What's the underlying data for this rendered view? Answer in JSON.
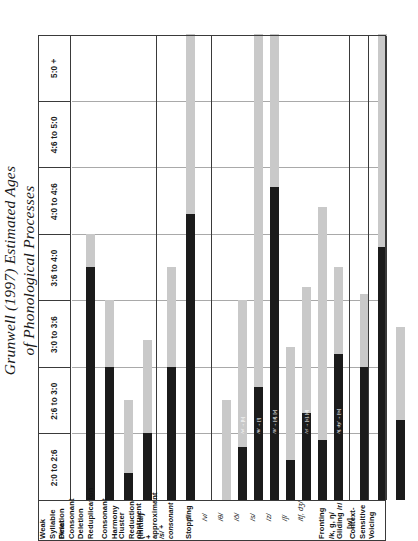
{
  "title": {
    "line1": "Grunwell (1997) Estimated Ages",
    "line2": "of Phonological Processes"
  },
  "axis": {
    "bands": [
      "2:0 to 2:6",
      "2:6 to 3:0",
      "3:0 to 3:6",
      "3:6 to 4:0",
      "4:0 to 4:6",
      "4:6 to 5:0",
      "5:0 +"
    ]
  },
  "rows": [
    {
      "label": "Weak Syllable Deletion",
      "sub": "",
      "group": 0
    },
    {
      "label": "Final Consonant Deletion",
      "sub": "",
      "group": 1
    },
    {
      "label": "Reduplication",
      "sub": "",
      "group": 2
    },
    {
      "label": "Consonant Harmony",
      "sub": "",
      "group": 3
    },
    {
      "label": "Cluster Reduction (Initial)",
      "sub": "obstruent +",
      "group": 4
    },
    {
      "label": "",
      "sub": "approximant",
      "group": 4
    },
    {
      "label": "",
      "sub": "/s/ + consonant",
      "group": 4
    },
    {
      "label": "Stopping",
      "sub": "",
      "group": 5
    },
    {
      "label": "/f/",
      "sub": "",
      "group": 5
    },
    {
      "label": "/v/",
      "sub": "",
      "group": 5
    },
    {
      "label": "/θ/",
      "sub": "",
      "group": 5
    },
    {
      "label": "/ð/",
      "sub": "",
      "group": 5
    },
    {
      "label": "/s/",
      "sub": "",
      "group": 5
    },
    {
      "label": "/z/",
      "sub": "",
      "group": 5
    },
    {
      "label": "/ʃ/",
      "sub": "",
      "group": 5
    },
    {
      "label": "/tʃ, dʒ/",
      "sub": "",
      "group": 5
    },
    {
      "label": "Fronting /k, g, ŋ/",
      "sub": "",
      "group": 6
    },
    {
      "label": "Gliding /r/ → [w]",
      "sub": "",
      "group": 7
    },
    {
      "label": "Context-Sensitive Voicing",
      "sub": "",
      "group": 8
    }
  ],
  "chart_data": {
    "type": "bar",
    "orientation": "vertical-rotated",
    "title": "Grunwell (1997) Estimated Ages of Phonological Processes",
    "xlabel": "Phonological Process",
    "ylabel": "Age (years:months)",
    "categories": [
      "2:0 to 2:6",
      "2:6 to 3:0",
      "3:0 to 3:6",
      "3:6 to 4:0",
      "4:0 to 4:6",
      "4:6 to 5:0",
      "5:0 +"
    ],
    "legend": [
      {
        "name": "Typically present / established",
        "color": "#1b1b1b"
      },
      {
        "name": "Variable / diminishing",
        "color": "#c9c9c9"
      }
    ],
    "grid": true,
    "ylim": [
      0,
      7
    ],
    "series": [
      {
        "process": "Weak Syllable Deletion",
        "dark_start": 0,
        "dark_end": 3.5,
        "light_end": 4.0,
        "annotation": ""
      },
      {
        "process": "Final Consonant Deletion",
        "dark_start": 0,
        "dark_end": 2.0,
        "light_end": 3.0,
        "annotation": ""
      },
      {
        "process": "Reduplication",
        "dark_start": 0,
        "dark_end": 0.4,
        "light_end": 1.5,
        "annotation": ""
      },
      {
        "process": "Consonant Harmony",
        "dark_start": 0,
        "dark_end": 1.0,
        "light_end": 2.4,
        "annotation": ""
      },
      {
        "process": "Cluster Reduction – obstruent + approximant",
        "dark_start": 0,
        "dark_end": 2.0,
        "light_end": 3.5,
        "annotation": ""
      },
      {
        "process": "Cluster Reduction – /s/ + consonant",
        "dark_start": 0,
        "dark_end": 4.3,
        "light_end": 7.0,
        "annotation": ""
      },
      {
        "process": "Stopping /f/",
        "dark_start": 0,
        "dark_end": 0,
        "light_end": 1.5,
        "annotation": ""
      },
      {
        "process": "Stopping /v/",
        "dark_start": 0,
        "dark_end": 0.8,
        "light_end": 3.0,
        "annotation": "/v/ → [b]"
      },
      {
        "process": "Stopping /θ/",
        "dark_start": 0,
        "dark_end": 1.7,
        "light_end": 7.0,
        "annotation": "/θ/ → [f]"
      },
      {
        "process": "Stopping /ð/",
        "dark_start": 0,
        "dark_end": 4.7,
        "light_end": 7.0,
        "annotation": "/ð/ → [d], [v]"
      },
      {
        "process": "Stopping /s/",
        "dark_start": 0,
        "dark_end": 0.6,
        "light_end": 2.3,
        "annotation": ""
      },
      {
        "process": "Stopping /z/",
        "dark_start": 0,
        "dark_end": 1.3,
        "light_end": 3.2,
        "annotation": "/z/ → [s], [d]"
      },
      {
        "process": "Stopping /ʃ/",
        "dark_start": 0,
        "dark_end": 0.9,
        "light_end": 4.4,
        "annotation": ""
      },
      {
        "process": "Stopping /tʃ, dʒ/",
        "dark_start": 0,
        "dark_end": 2.2,
        "light_end": 3.5,
        "annotation": "/tʃ, dʒ/ → [ts]"
      },
      {
        "process": "Fronting /k, g, ŋ/",
        "dark_start": 0,
        "dark_end": 2.0,
        "light_end": 3.1,
        "annotation": ""
      },
      {
        "process": "Gliding /r/ → [w]",
        "dark_start": 0,
        "dark_end": 3.8,
        "light_end": 7.0,
        "annotation": ""
      },
      {
        "process": "Context-Sensitive Voicing",
        "dark_start": 0,
        "dark_end": 1.2,
        "light_end": 2.6,
        "annotation": ""
      }
    ]
  }
}
